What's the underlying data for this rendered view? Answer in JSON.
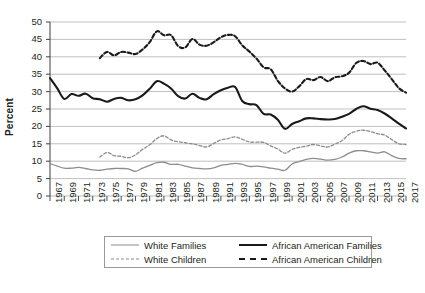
{
  "chart_data": {
    "type": "line",
    "title": "",
    "xlabel": "",
    "ylabel": "Percent",
    "ylim": [
      0,
      50
    ],
    "ytick_step": 5,
    "yticks": [
      "0",
      "5",
      "10",
      "15",
      "20",
      "25",
      "30",
      "35",
      "40",
      "45",
      "50"
    ],
    "xlim": [
      1967,
      2017
    ],
    "grid": "horizontal",
    "legend_position": "below-plot",
    "xticks": [
      "1967",
      "1969",
      "1971",
      "1973",
      "1975",
      "1977",
      "1979",
      "1981",
      "1983",
      "1985",
      "1987",
      "1989",
      "1991",
      "1993",
      "1995",
      "1997",
      "1999",
      "2001",
      "2003",
      "2005",
      "2007",
      "2009",
      "2011",
      "2013",
      "2015",
      "2017"
    ],
    "x": [
      1967,
      1968,
      1969,
      1970,
      1971,
      1972,
      1973,
      1974,
      1975,
      1976,
      1977,
      1978,
      1979,
      1980,
      1981,
      1982,
      1983,
      1984,
      1985,
      1986,
      1987,
      1988,
      1989,
      1990,
      1991,
      1992,
      1993,
      1994,
      1995,
      1996,
      1997,
      1998,
      1999,
      2000,
      2001,
      2002,
      2003,
      2004,
      2005,
      2006,
      2007,
      2008,
      2009,
      2010,
      2011,
      2012,
      2013,
      2014,
      2015,
      2016,
      2017
    ],
    "series": [
      {
        "name": "White Families",
        "style": "solid",
        "color": "#8d8d8d",
        "width": 1.3,
        "values": [
          9.3,
          8.6,
          8.0,
          8.0,
          8.2,
          7.9,
          7.5,
          7.4,
          7.7,
          7.9,
          7.9,
          7.8,
          7.1,
          8.0,
          8.8,
          9.6,
          9.7,
          9.1,
          9.1,
          8.6,
          8.1,
          7.9,
          7.8,
          8.1,
          8.8,
          9.1,
          9.4,
          9.1,
          8.5,
          8.6,
          8.4,
          8.0,
          7.7,
          7.4,
          9.2,
          9.9,
          10.5,
          10.8,
          10.6,
          10.3,
          10.5,
          11.2,
          12.3,
          13.0,
          13.0,
          12.7,
          12.3,
          12.7,
          11.6,
          10.8,
          10.7
        ]
      },
      {
        "name": "White Children",
        "style": "dashed",
        "color": "#8d8d8d",
        "width": 1.3,
        "values": [
          null,
          null,
          null,
          null,
          null,
          null,
          null,
          11.2,
          12.5,
          11.6,
          11.4,
          11.0,
          11.8,
          13.4,
          14.7,
          16.5,
          17.3,
          16.1,
          15.6,
          15.3,
          15.0,
          14.5,
          14.1,
          15.1,
          16.1,
          16.5,
          17.0,
          16.3,
          15.5,
          15.5,
          15.4,
          14.4,
          13.5,
          12.3,
          13.4,
          14.0,
          14.3,
          14.8,
          14.4,
          14.1,
          14.9,
          15.9,
          17.7,
          18.6,
          18.9,
          18.5,
          17.9,
          17.5,
          16.2,
          15.0,
          14.8
        ]
      },
      {
        "name": "African American Families",
        "style": "solid",
        "color": "#1a1a1a",
        "width": 2.1,
        "values": [
          33.9,
          31.0,
          27.9,
          29.3,
          28.8,
          29.4,
          28.1,
          27.8,
          27.1,
          27.9,
          28.2,
          27.5,
          27.8,
          28.9,
          30.8,
          33.0,
          32.3,
          30.9,
          28.7,
          28.0,
          29.4,
          28.2,
          27.8,
          29.3,
          30.4,
          31.1,
          31.3,
          27.3,
          26.4,
          26.1,
          23.6,
          23.4,
          21.9,
          19.3,
          20.7,
          21.5,
          22.3,
          22.3,
          22.1,
          22.0,
          22.1,
          22.8,
          23.6,
          25.0,
          25.8,
          25.1,
          24.7,
          23.7,
          22.3,
          20.8,
          19.4
        ]
      },
      {
        "name": "African American Children",
        "style": "dashed",
        "color": "#1a1a1a",
        "width": 2.1,
        "values": [
          null,
          null,
          null,
          null,
          null,
          null,
          null,
          39.6,
          41.4,
          40.4,
          41.4,
          41.2,
          40.8,
          42.1,
          44.2,
          47.3,
          46.2,
          46.2,
          43.1,
          42.7,
          45.1,
          43.5,
          43.2,
          44.2,
          45.6,
          46.3,
          45.9,
          43.3,
          41.5,
          39.5,
          37.0,
          36.4,
          33.1,
          30.9,
          30.0,
          31.5,
          33.6,
          33.3,
          34.2,
          33.0,
          34.1,
          34.4,
          35.4,
          38.2,
          38.8,
          37.9,
          38.3,
          36.1,
          33.6,
          31.0,
          29.7
        ]
      }
    ]
  }
}
